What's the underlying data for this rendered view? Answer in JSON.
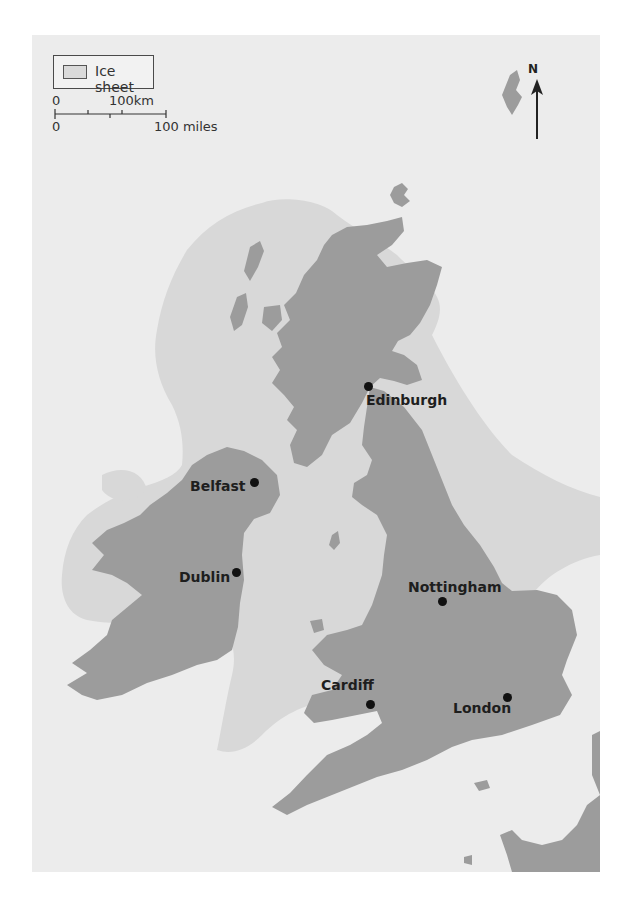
{
  "map": {
    "title": "British Isles ice sheet extent",
    "colors": {
      "sea": "#ececec",
      "ice_sheet": "#d8d8d8",
      "land": "#9c9c9c",
      "text": "#1e1e1e",
      "page": "#ffffff"
    },
    "legend": {
      "items": [
        {
          "label": "Ice sheet",
          "swatch": "ice-sheet-swatch"
        }
      ]
    },
    "scale_bar": {
      "km_start": "0",
      "km_end": "100km",
      "miles_start": "0",
      "miles_end": "100 miles"
    },
    "north_arrow": {
      "label": "N",
      "icon": "north-arrow-icon"
    },
    "cities": [
      {
        "name": "Edinburgh",
        "dot_x": 336,
        "dot_y": 351,
        "label_x": 334,
        "label_y": 357
      },
      {
        "name": "Belfast",
        "dot_x": 222,
        "dot_y": 447,
        "label_x": 158,
        "label_y": 443
      },
      {
        "name": "Dublin",
        "dot_x": 204,
        "dot_y": 537,
        "label_x": 147,
        "label_y": 534
      },
      {
        "name": "Nottingham",
        "dot_x": 410,
        "dot_y": 566,
        "label_x": 376,
        "label_y": 544
      },
      {
        "name": "Cardiff",
        "dot_x": 338,
        "dot_y": 669,
        "label_x": 289,
        "label_y": 642
      },
      {
        "name": "London",
        "dot_x": 475,
        "dot_y": 662,
        "label_x": 421,
        "label_y": 665
      }
    ]
  }
}
